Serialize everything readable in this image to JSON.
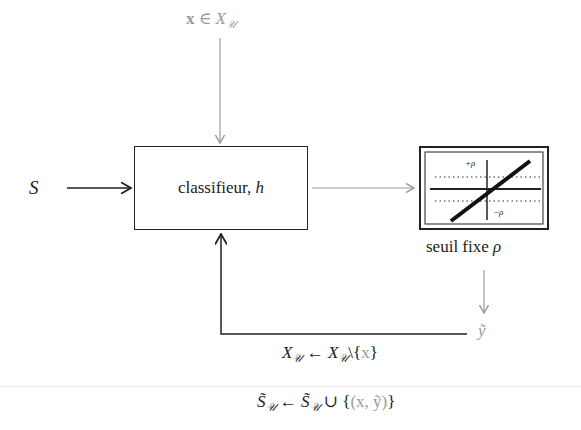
{
  "input_top": {
    "label_bold_x": "x",
    "symbol_in": " ∈ ",
    "set": "X",
    "set_sub": "𝒰"
  },
  "input_left": {
    "label": "S"
  },
  "classifier": {
    "label": "classifieur, ",
    "var": "h"
  },
  "threshold": {
    "caption": "seuil fixe ",
    "caption_var": "ρ",
    "plus_label": "+ρ",
    "minus_label": "−ρ"
  },
  "output": {
    "label": "ỹ"
  },
  "update1": {
    "lhs": "X",
    "lhs_sub": "𝒰",
    "arrow": " ← ",
    "rhs": "X",
    "rhs_sub": "𝒰",
    "rest": "\\{",
    "x": "x",
    "close": "}"
  },
  "update2": {
    "lhs": "S̃",
    "lhs_sub": "𝒰",
    "arrow": " ← ",
    "rhs": "S̃",
    "rhs_sub": "𝒰",
    "union": " ∪ {",
    "pair": "(x, ỹ)",
    "close": "}"
  },
  "colors": {
    "main": "#222222",
    "gray": "#9a9a9a"
  }
}
